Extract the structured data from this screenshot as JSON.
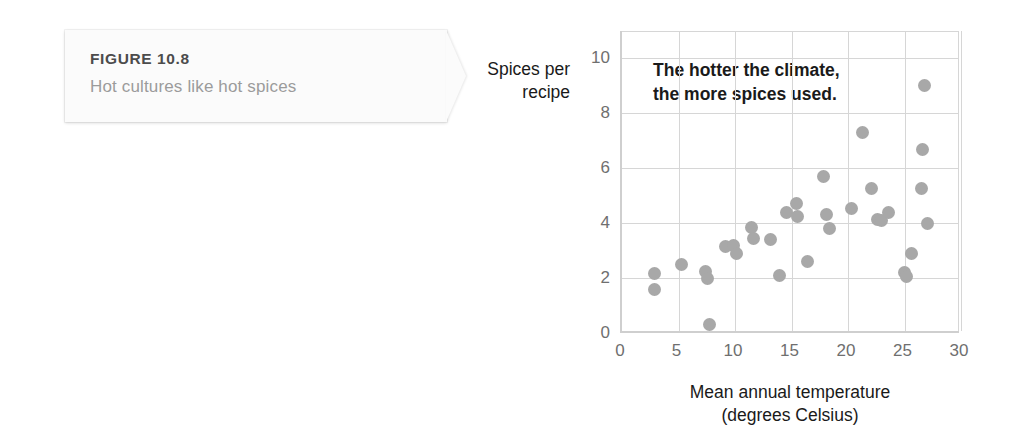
{
  "figure": {
    "label": "FIGURE 10.8",
    "caption": "Hot cultures like hot spices"
  },
  "chart_data": {
    "type": "scatter",
    "title": "",
    "annotation": "The hotter the climate,\nthe more spices used.",
    "annotation_line1": "The hotter the climate,",
    "annotation_line2": "the more spices used.",
    "xlabel_line1": "Mean annual temperature",
    "xlabel_line2": "(degrees Celsius)",
    "ylabel_line1": "Spices per",
    "ylabel_line2": "recipe",
    "xlim": [
      0,
      30
    ],
    "ylim": [
      0,
      11
    ],
    "xticks": [
      0,
      5,
      10,
      15,
      20,
      25,
      30
    ],
    "yticks": [
      0,
      2,
      4,
      6,
      8,
      10
    ],
    "grid": true,
    "legend": "none",
    "marker_color": "#a8a8a8",
    "axis_color": "#cfcfcf",
    "grid_color": "#d6d6d6",
    "points": [
      {
        "x": 2.9,
        "y": 2.15
      },
      {
        "x": 2.9,
        "y": 1.6
      },
      {
        "x": 5.3,
        "y": 2.5
      },
      {
        "x": 7.4,
        "y": 2.25
      },
      {
        "x": 7.6,
        "y": 2.0
      },
      {
        "x": 7.7,
        "y": 0.3
      },
      {
        "x": 9.2,
        "y": 3.15
      },
      {
        "x": 9.9,
        "y": 3.2
      },
      {
        "x": 10.1,
        "y": 2.9
      },
      {
        "x": 11.5,
        "y": 3.85
      },
      {
        "x": 11.6,
        "y": 3.45
      },
      {
        "x": 13.1,
        "y": 3.4
      },
      {
        "x": 13.9,
        "y": 2.1
      },
      {
        "x": 14.6,
        "y": 4.4
      },
      {
        "x": 15.4,
        "y": 4.7
      },
      {
        "x": 15.5,
        "y": 4.25
      },
      {
        "x": 16.4,
        "y": 2.6
      },
      {
        "x": 17.8,
        "y": 5.7
      },
      {
        "x": 18.1,
        "y": 4.3
      },
      {
        "x": 18.4,
        "y": 3.8
      },
      {
        "x": 20.3,
        "y": 4.55
      },
      {
        "x": 21.3,
        "y": 7.3
      },
      {
        "x": 22.1,
        "y": 5.25
      },
      {
        "x": 22.6,
        "y": 4.15
      },
      {
        "x": 23.0,
        "y": 4.1
      },
      {
        "x": 23.6,
        "y": 4.4
      },
      {
        "x": 25.0,
        "y": 2.2
      },
      {
        "x": 25.2,
        "y": 2.05
      },
      {
        "x": 25.6,
        "y": 2.9
      },
      {
        "x": 26.5,
        "y": 5.25
      },
      {
        "x": 26.6,
        "y": 6.7
      },
      {
        "x": 26.8,
        "y": 9.0
      },
      {
        "x": 27.0,
        "y": 4.0
      }
    ]
  }
}
